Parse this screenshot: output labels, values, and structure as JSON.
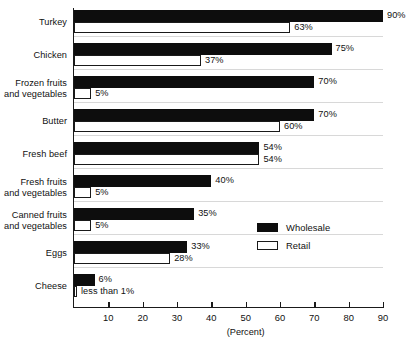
{
  "chart_data": {
    "type": "bar",
    "orientation": "horizontal",
    "title": "",
    "xlabel": "(Percent)",
    "ylabel": "",
    "xlim": [
      0,
      90
    ],
    "xticks": [
      10,
      20,
      30,
      40,
      50,
      60,
      70,
      80,
      90
    ],
    "grid": false,
    "legend_position": "inside-right",
    "categories": [
      "Turkey",
      "Chicken",
      "Frozen fruits\nand vegetables",
      "Butter",
      "Fresh beef",
      "Fresh fruits\nand vegetables",
      "Canned fruits\nand vegetables",
      "Eggs",
      "Cheese"
    ],
    "series": [
      {
        "name": "Wholesale",
        "color": "#0d0d0d",
        "values": [
          90,
          75,
          70,
          70,
          54,
          40,
          35,
          33,
          6
        ],
        "labels": [
          "90%",
          "75%",
          "70%",
          "70%",
          "54%",
          "40%",
          "35%",
          "33%",
          "6%"
        ]
      },
      {
        "name": "Retail",
        "color": "#ffffff",
        "values": [
          63,
          37,
          5,
          60,
          54,
          5,
          5,
          28,
          0.5
        ],
        "labels": [
          "63%",
          "37%",
          "5%",
          "60%",
          "54%",
          "5%",
          "5%",
          "28%",
          "less than 1%"
        ]
      }
    ]
  },
  "legend": {
    "entries": [
      {
        "label": "Wholesale"
      },
      {
        "label": "Retail"
      }
    ]
  },
  "axis": {
    "caption": "(Percent)",
    "tick_labels": [
      "10",
      "20",
      "30",
      "40",
      "50",
      "60",
      "70",
      "80",
      "90"
    ]
  }
}
